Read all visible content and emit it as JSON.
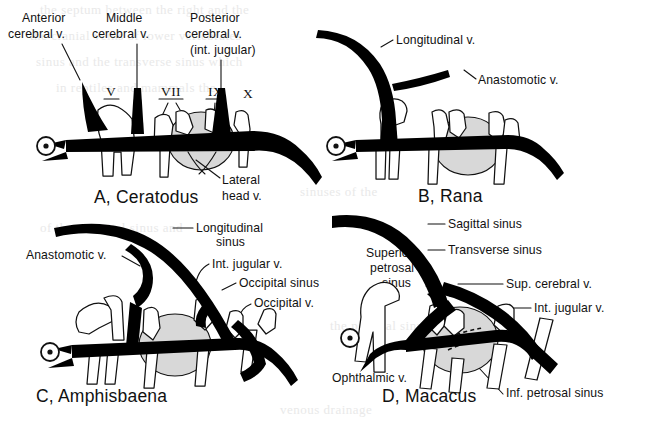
{
  "figure": {
    "kind": "comparative-anatomy-line-diagram",
    "background_color": "#ffffff",
    "ink_color": "#111111",
    "vessel_fill": "#000000",
    "otic_capsule_fill": "#d8d8d8",
    "eye_symbol_name": "eye-symbol"
  },
  "panels": [
    {
      "id": "A",
      "title": "A, Ceratodus",
      "labels": [
        {
          "key": "anterior_cerebral",
          "text": "Anterior\ncerebral v.",
          "line1": "Anterior",
          "line2": "cerebral v."
        },
        {
          "key": "middle_cerebral",
          "text": "Middle\ncerebral v.",
          "line1": "Middle",
          "line2": "cerebral v."
        },
        {
          "key": "posterior_cerebral",
          "text": "Posterior\ncerebral v.\n(int. jugular)",
          "line1": "Posterior",
          "line2": "cerebral v.",
          "line3": "(int. jugular)"
        },
        {
          "key": "lateral_head",
          "text": "Lateral\nhead v.",
          "line1": "Lateral",
          "line2": "head v."
        }
      ],
      "cranial_nerves": [
        {
          "numeral": "V",
          "underlined": true
        },
        {
          "numeral": "VII",
          "underlined": true
        },
        {
          "numeral": "IX",
          "underlined": true
        },
        {
          "numeral": "X",
          "underlined": false
        }
      ]
    },
    {
      "id": "B",
      "title": "B, Rana",
      "labels": [
        {
          "key": "longitudinal_v",
          "text": "Longitudinal v."
        },
        {
          "key": "anastomotic_v",
          "text": "Anastomotic v."
        }
      ],
      "cranial_nerves": []
    },
    {
      "id": "C",
      "title": "C, Amphisbaena",
      "labels": [
        {
          "key": "longitudinal_sinus",
          "text": "Longitudinal\nsinus",
          "line1": "Longitudinal",
          "line2": "sinus"
        },
        {
          "key": "anastomotic_v",
          "text": "Anastomotic v."
        },
        {
          "key": "int_jugular_v",
          "text": "Int. jugular v."
        },
        {
          "key": "occipital_sinus",
          "text": "Occipital sinus"
        },
        {
          "key": "occipital_v",
          "text": "Occipital v."
        }
      ],
      "cranial_nerves": []
    },
    {
      "id": "D",
      "title": "D, Macacus",
      "labels": [
        {
          "key": "sagittal_sinus",
          "text": "Sagittal sinus"
        },
        {
          "key": "transverse_sinus",
          "text": "Transverse sinus"
        },
        {
          "key": "superior_petrosal_sinus",
          "text": "Superior\npetrosal\nsinus",
          "line1": "Superior",
          "line2": "petrosal",
          "line3": "sinus"
        },
        {
          "key": "sup_cerebral_v",
          "text": "Sup. cerebral v."
        },
        {
          "key": "int_jugular_v",
          "text": "Int. jugular v."
        },
        {
          "key": "ophthalmic_v",
          "text": "Ophthalmic v."
        },
        {
          "key": "inf_petrosal_sinus",
          "text": "Inf. petrosal sinus"
        }
      ],
      "cranial_nerves": []
    }
  ]
}
